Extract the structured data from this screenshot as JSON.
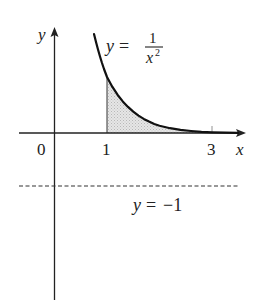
{
  "diagram": {
    "type": "function-graph",
    "function_label": {
      "lhs": "y",
      "equals": "=",
      "numerator": "1",
      "denominator_base": "x",
      "denominator_exp": "2"
    },
    "axes": {
      "x_label": "x",
      "y_label": "y",
      "origin_label": "0"
    },
    "x_ticks": [
      {
        "value": 1,
        "label": "1"
      },
      {
        "value": 3,
        "label": "3"
      }
    ],
    "shaded_region": {
      "from": 1,
      "to": 3,
      "description": "area under y = 1/x^2 between x = 1 and x = 3"
    },
    "horizontal_line": {
      "lhs": "y",
      "equals": "=",
      "value": "−1",
      "style": "dashed"
    },
    "colors": {
      "curve": "#111111",
      "axis": "#222222",
      "shade": "#d9d9d9",
      "dash": "#333333"
    }
  }
}
